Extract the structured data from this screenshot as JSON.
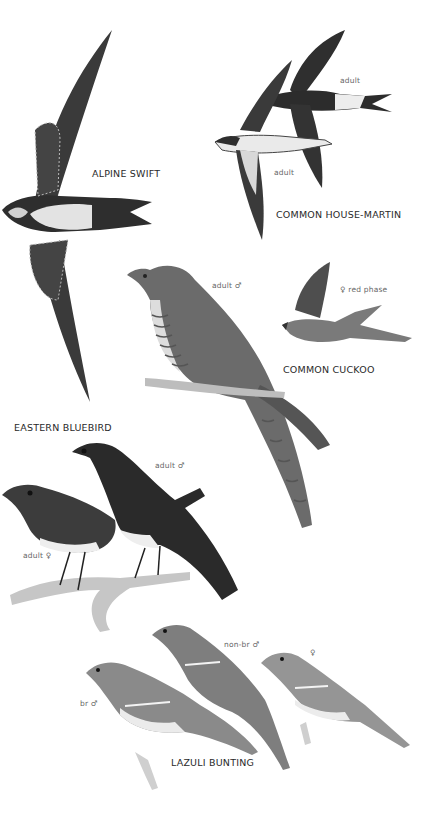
{
  "plate": {
    "background": "#ffffff",
    "ink_dark": "#2b2b2b",
    "ink_mid": "#6e6e6e",
    "ink_light": "#d6d6d6"
  },
  "species": [
    {
      "name": "ALPINE SWIFT",
      "labels": []
    },
    {
      "name": "COMMON HOUSE-MARTIN",
      "labels": [
        "adult",
        "adult"
      ]
    },
    {
      "name": "COMMON CUCKOO",
      "labels": [
        "adult ♂",
        "♀ red phase"
      ]
    },
    {
      "name": "EASTERN BLUEBIRD",
      "labels": [
        "adult ♂",
        "adult ♀"
      ]
    },
    {
      "name": "LAZULI BUNTING",
      "labels": [
        "br ♂",
        "non-br ♂",
        "♀"
      ]
    }
  ]
}
